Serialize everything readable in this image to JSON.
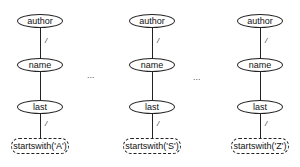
{
  "diagram": {
    "trees": [
      {
        "nodes": [
          "author",
          "name",
          "last"
        ],
        "predicate": "startswith('A')",
        "edge_labels": {
          "author_name": "/",
          "last_predicate": "/"
        }
      },
      {
        "nodes": [
          "author",
          "name",
          "last"
        ],
        "predicate": "startswith('S')",
        "edge_labels": {
          "author_name": "/",
          "last_predicate": "/"
        }
      },
      {
        "nodes": [
          "author",
          "name",
          "last"
        ],
        "predicate": "startswith('Z')",
        "edge_labels": {
          "author_name": "/",
          "last_predicate": "/"
        }
      }
    ],
    "separators": [
      "...",
      "..."
    ]
  }
}
